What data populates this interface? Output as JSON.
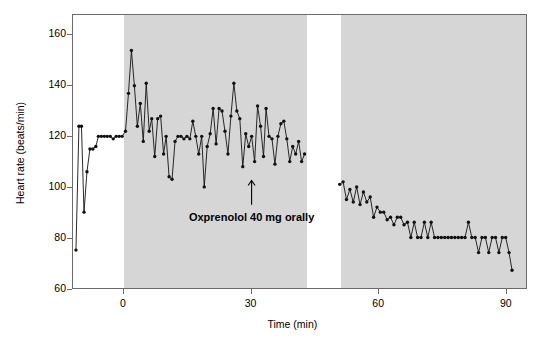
{
  "chart_data": {
    "type": "line",
    "title": "",
    "xlabel": "Time (min)",
    "ylabel": "Heart rate (beats/min)",
    "xlim": [
      -12,
      95
    ],
    "ylim": [
      60,
      168
    ],
    "xticks": [
      0,
      30,
      60,
      90
    ],
    "yticks": [
      60,
      80,
      100,
      120,
      140,
      160
    ],
    "grid": false,
    "legend": "none",
    "marker": "filled-circle",
    "line_color": "#111111",
    "band_color": "#d6d6d6",
    "phases": [
      {
        "label": "Control",
        "x_start": -12,
        "x_end": 0,
        "shaded": false
      },
      {
        "label": "First half",
        "x_start": 0,
        "x_end": 43,
        "shaded": true
      },
      {
        "label": "Interval",
        "x_start": 43,
        "x_end": 51,
        "shaded": false
      },
      {
        "label": "Second half",
        "x_start": 51,
        "x_end": 95,
        "shaded": true
      }
    ],
    "annotations": [
      {
        "text": "Oxprenolol 40 mg orally",
        "x": 30,
        "y": 88,
        "arrow_to_y": 103
      }
    ],
    "series": [
      {
        "name": "Heart rate",
        "points": [
          [
            -11.3,
            75
          ],
          [
            -10.6,
            124
          ],
          [
            -10.0,
            124
          ],
          [
            -9.4,
            90
          ],
          [
            -8.7,
            106
          ],
          [
            -8.0,
            115
          ],
          [
            -7.3,
            115
          ],
          [
            -6.6,
            116
          ],
          [
            -6.0,
            120
          ],
          [
            -5.3,
            120
          ],
          [
            -4.6,
            120
          ],
          [
            -3.9,
            120
          ],
          [
            -3.2,
            120
          ],
          [
            -2.5,
            119
          ],
          [
            -1.8,
            120
          ],
          [
            -1.1,
            120
          ],
          [
            -0.4,
            120
          ],
          [
            0.4,
            122
          ],
          [
            1.1,
            137
          ],
          [
            1.8,
            154
          ],
          [
            2.5,
            140
          ],
          [
            3.2,
            124
          ],
          [
            3.9,
            133
          ],
          [
            4.6,
            118
          ],
          [
            5.3,
            141
          ],
          [
            6.0,
            122
          ],
          [
            6.6,
            127
          ],
          [
            7.3,
            112
          ],
          [
            8.0,
            127
          ],
          [
            8.7,
            128
          ],
          [
            9.4,
            113
          ],
          [
            10.0,
            120
          ],
          [
            10.7,
            104
          ],
          [
            11.4,
            103
          ],
          [
            12.1,
            118
          ],
          [
            12.8,
            120
          ],
          [
            13.5,
            120
          ],
          [
            14.2,
            119
          ],
          [
            14.9,
            120
          ],
          [
            15.6,
            119
          ],
          [
            16.3,
            126
          ],
          [
            17.0,
            120
          ],
          [
            17.7,
            113
          ],
          [
            18.4,
            120
          ],
          [
            19.0,
            100
          ],
          [
            19.7,
            116
          ],
          [
            20.4,
            121
          ],
          [
            21.1,
            131
          ],
          [
            21.8,
            117
          ],
          [
            22.5,
            131
          ],
          [
            23.2,
            130
          ],
          [
            23.9,
            122
          ],
          [
            24.6,
            113
          ],
          [
            25.3,
            128
          ],
          [
            26.0,
            141
          ],
          [
            26.7,
            130
          ],
          [
            27.4,
            127
          ],
          [
            28.1,
            108
          ],
          [
            28.8,
            121
          ],
          [
            29.5,
            116
          ],
          [
            30.2,
            120
          ],
          [
            30.9,
            110
          ],
          [
            31.6,
            132
          ],
          [
            32.3,
            124
          ],
          [
            33.0,
            112
          ],
          [
            33.6,
            131
          ],
          [
            34.3,
            120
          ],
          [
            35.0,
            119
          ],
          [
            35.7,
            109
          ],
          [
            36.4,
            120
          ],
          [
            37.1,
            125
          ],
          [
            37.8,
            126
          ],
          [
            38.5,
            119
          ],
          [
            39.2,
            110
          ],
          [
            39.9,
            116
          ],
          [
            40.6,
            113
          ],
          [
            41.3,
            118
          ],
          [
            42.0,
            110
          ],
          [
            42.7,
            113
          ],
          [
            51.0,
            101
          ],
          [
            51.8,
            102
          ],
          [
            52.6,
            95
          ],
          [
            53.4,
            99
          ],
          [
            54.2,
            94
          ],
          [
            55.0,
            100
          ],
          [
            55.8,
            93
          ],
          [
            56.6,
            98
          ],
          [
            57.4,
            94
          ],
          [
            58.2,
            96
          ],
          [
            59.0,
            88
          ],
          [
            59.8,
            92
          ],
          [
            60.6,
            90
          ],
          [
            61.4,
            90
          ],
          [
            62.2,
            87
          ],
          [
            63.0,
            88
          ],
          [
            63.8,
            85
          ],
          [
            64.6,
            88
          ],
          [
            65.4,
            88
          ],
          [
            66.2,
            85
          ],
          [
            67.0,
            86
          ],
          [
            67.8,
            80
          ],
          [
            68.6,
            86
          ],
          [
            69.4,
            80
          ],
          [
            70.2,
            80
          ],
          [
            71.0,
            86
          ],
          [
            71.8,
            80
          ],
          [
            72.6,
            86
          ],
          [
            73.4,
            80
          ],
          [
            74.2,
            80
          ],
          [
            75.0,
            80
          ],
          [
            75.8,
            80
          ],
          [
            76.6,
            80
          ],
          [
            77.4,
            80
          ],
          [
            78.2,
            80
          ],
          [
            79.0,
            80
          ],
          [
            79.8,
            80
          ],
          [
            80.6,
            80
          ],
          [
            81.4,
            86
          ],
          [
            82.2,
            80
          ],
          [
            83.0,
            80
          ],
          [
            83.8,
            74
          ],
          [
            84.6,
            80
          ],
          [
            85.4,
            80
          ],
          [
            86.2,
            74
          ],
          [
            87.0,
            80
          ],
          [
            87.8,
            80
          ],
          [
            88.6,
            74
          ],
          [
            89.4,
            80
          ],
          [
            90.2,
            80
          ],
          [
            91.0,
            74
          ],
          [
            91.7,
            67
          ]
        ]
      }
    ]
  }
}
